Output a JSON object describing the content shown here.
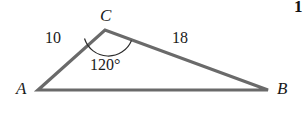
{
  "figure": {
    "type": "triangle-diagram",
    "background_color": "#ffffff",
    "stroke_color": "#6a6a6a",
    "arc_color": "#2b2b2b",
    "text_color": "#1a1a1a",
    "vertices": {
      "A": {
        "label": "A",
        "x": 38,
        "y": 90
      },
      "B": {
        "label": "B",
        "x": 268,
        "y": 90
      },
      "C": {
        "label": "C",
        "x": 105,
        "y": 30
      }
    },
    "sides": {
      "CA": {
        "label": "10",
        "value": 10
      },
      "CB": {
        "label": "18",
        "value": 18
      },
      "AB": {
        "label": "",
        "value": null
      }
    },
    "angles": {
      "C": {
        "label": "120°",
        "value": 120,
        "unit": "degrees"
      }
    },
    "corner_mark": {
      "label": "1"
    }
  }
}
